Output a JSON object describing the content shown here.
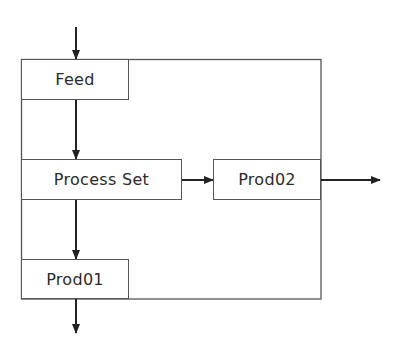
{
  "diagram": {
    "type": "process-flow",
    "container": {
      "label": ""
    },
    "nodes": [
      {
        "id": "feed",
        "label": "Feed"
      },
      {
        "id": "process_set",
        "label": "Process Set"
      },
      {
        "id": "prod02",
        "label": "Prod02"
      },
      {
        "id": "prod01",
        "label": "Prod01"
      }
    ],
    "edges": [
      {
        "from": "external-input",
        "to": "feed"
      },
      {
        "from": "feed",
        "to": "process_set"
      },
      {
        "from": "process_set",
        "to": "prod02"
      },
      {
        "from": "prod02",
        "to": "external-output-right"
      },
      {
        "from": "process_set",
        "to": "prod01"
      },
      {
        "from": "prod01",
        "to": "external-output-bottom"
      }
    ],
    "colors": {
      "line": "#555555",
      "arrow": "#222222",
      "text": "#2a2a2a"
    }
  }
}
